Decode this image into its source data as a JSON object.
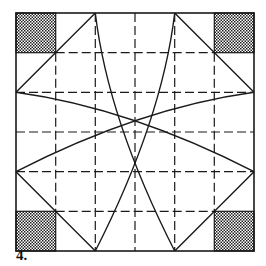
{
  "figure": {
    "label": "4.",
    "square": {
      "x": 16,
      "y": 13,
      "size": 238
    },
    "grid_divisions": 6,
    "stroke_color": "#1a1a1a",
    "shade_pattern": "checkered"
  }
}
